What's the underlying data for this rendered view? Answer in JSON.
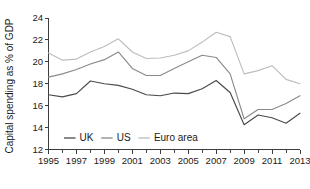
{
  "chart_data": {
    "type": "line",
    "title": "",
    "subtitle": "",
    "xlabel": "",
    "ylabel": "Capital spending as % of GDP",
    "x": [
      1995,
      1996,
      1997,
      1998,
      1999,
      2000,
      2001,
      2002,
      2003,
      2004,
      2005,
      2006,
      2007,
      2008,
      2009,
      2010,
      2011,
      2012,
      2013
    ],
    "xlim": [
      1995,
      2013
    ],
    "ylim": [
      12,
      24
    ],
    "y_ticks": [
      12,
      14,
      16,
      18,
      20,
      22,
      24
    ],
    "y_tick_labels": [
      "12",
      "14",
      "16",
      "18",
      "20",
      "22",
      "24"
    ],
    "x_ticks": [
      1995,
      1996,
      1997,
      1998,
      1999,
      2000,
      2001,
      2002,
      2003,
      2004,
      2005,
      2006,
      2007,
      2008,
      2009,
      2010,
      2011,
      2012,
      2013
    ],
    "x_tick_labels": [
      "1995",
      "",
      "1997",
      "",
      "1999",
      "",
      "2001",
      "",
      "2003",
      "",
      "2005",
      "",
      "2007",
      "",
      "2009",
      "",
      "2011",
      "",
      "2013"
    ],
    "x_labelled_ticks": [
      "1995",
      "1997",
      "1999",
      "2001",
      "2003",
      "2005",
      "2007",
      "2009",
      "2011",
      "2013"
    ],
    "grid": false,
    "legend_position": "inside-bottom-left",
    "series": [
      {
        "name": "UK",
        "color": "#4a4a4a",
        "values": [
          17.0,
          16.8,
          17.1,
          18.25,
          18.0,
          17.85,
          17.5,
          17.0,
          16.9,
          17.15,
          17.1,
          17.55,
          18.3,
          17.2,
          14.25,
          15.15,
          14.9,
          14.4,
          15.3
        ]
      },
      {
        "name": "US",
        "color": "#8a8a8a",
        "values": [
          18.6,
          18.9,
          19.3,
          19.8,
          20.2,
          20.9,
          19.4,
          18.75,
          18.75,
          19.4,
          20.0,
          20.6,
          20.4,
          18.9,
          14.8,
          15.65,
          15.65,
          16.2,
          16.9
        ]
      },
      {
        "name": "Euro area",
        "color": "#bdbdbd",
        "values": [
          20.8,
          20.15,
          20.25,
          20.9,
          21.4,
          22.1,
          20.9,
          20.3,
          20.35,
          20.6,
          21.0,
          21.8,
          22.7,
          22.3,
          18.9,
          19.2,
          19.65,
          18.4,
          18.0
        ]
      }
    ],
    "legend": [
      {
        "label": "UK",
        "color": "#4a4a4a"
      },
      {
        "label": "US",
        "color": "#8a8a8a"
      },
      {
        "label": "Euro area",
        "color": "#bdbdbd"
      }
    ]
  }
}
